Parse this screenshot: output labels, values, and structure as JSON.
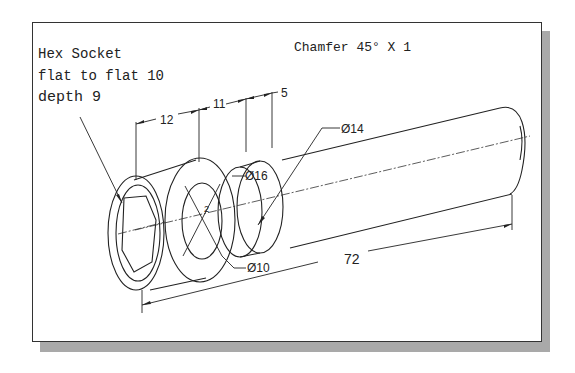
{
  "figure": {
    "type": "isometric-technical-drawing",
    "frame_color": "#333333",
    "shadow_color": "#a9a9a9",
    "notes": {
      "hex_socket": {
        "line1": "Hex Socket",
        "line2": "flat to flat 10",
        "line3": "depth 9"
      },
      "chamfer": "Chamfer 45° X 1"
    },
    "dimensions": {
      "len_12": "12",
      "len_11": "11",
      "len_5": "5",
      "dia_14": "Ø14",
      "dia_16": "Ø16",
      "dia_10": "Ø10",
      "total_72": "72",
      "small_2": "2"
    }
  }
}
